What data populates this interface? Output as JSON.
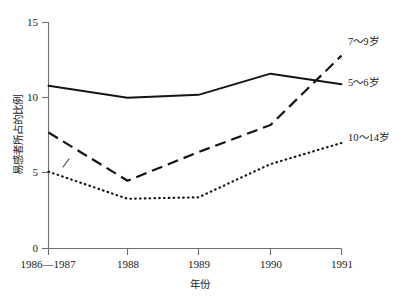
{
  "chart_data": {
    "type": "line",
    "title": "",
    "xlabel": "年份",
    "ylabel": "易感者所占的比例",
    "categories": [
      "1986—1987",
      "1988",
      "1989",
      "1990",
      "1991"
    ],
    "x_tick_labels": [
      "1986—1987",
      "1988",
      "1989",
      "1990",
      "1991"
    ],
    "y_tick_labels": [
      "0",
      "5",
      "10",
      "15"
    ],
    "y_ticks": [
      0,
      5,
      10,
      15
    ],
    "ylim": [
      0,
      15
    ],
    "grid": false,
    "legend_position": "right-inline",
    "series": [
      {
        "name": "5～6岁",
        "style": "solid",
        "label_x_value": "1991",
        "values": [
          10.8,
          10.0,
          10.2,
          11.6,
          10.9
        ]
      },
      {
        "name": "7～9岁",
        "style": "dashed",
        "label_x_value": "1991",
        "values": [
          7.7,
          4.5,
          6.4,
          8.2,
          12.8
        ]
      },
      {
        "name": "10～14岁",
        "style": "dotted",
        "label_x_value": "1991",
        "values": [
          5.1,
          3.3,
          3.4,
          5.6,
          7.0
        ]
      }
    ]
  },
  "axis": {
    "y_label_text": "易感者所占的比例",
    "x_label_text": "年份",
    "y_tick_0": "0",
    "y_tick_5": "5",
    "y_tick_10": "10",
    "y_tick_15": "15",
    "x_tick_0": "1986—1987",
    "x_tick_1": "1988",
    "x_tick_2": "1989",
    "x_tick_3": "1990",
    "x_tick_4": "1991"
  },
  "legend": {
    "series_0": "7～9岁",
    "series_1": "5～6岁",
    "series_2": "10～14岁"
  },
  "colors": {
    "line": "#141414",
    "axis": "#6f6f6f",
    "background": "#ffffff",
    "text": "#1a1a1a"
  }
}
